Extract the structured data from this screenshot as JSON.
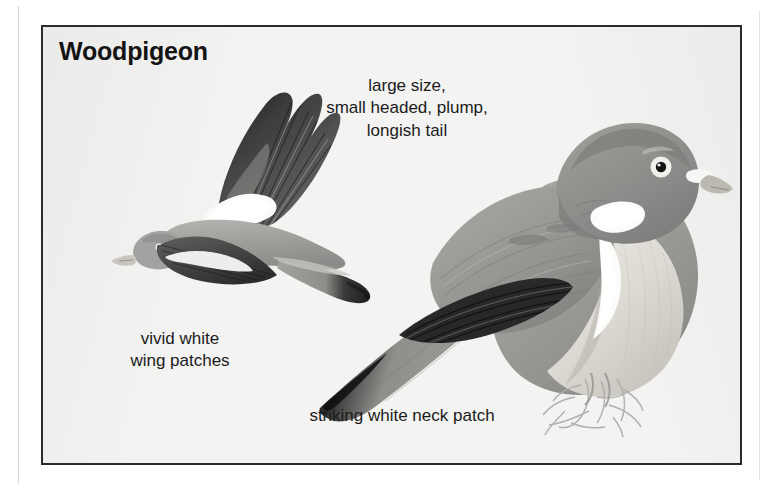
{
  "plate": {
    "title": "Woodpigeon",
    "background_color": "#f3f3f2",
    "border_color": "#2b2b2b",
    "text_color": "#1b1b1b"
  },
  "captions": {
    "traits": "large size,\nsmall headed, plump,\nlongish tail",
    "wing_patches": "vivid white\nwing patches",
    "neck_patch": "striking white neck patch"
  },
  "illustrations": {
    "flying": {
      "name": "woodpigeon-in-flight",
      "palette": {
        "body_grey": "#9a9a98",
        "body_light": "#b9b9b6",
        "wing_dark": "#3a3a3a",
        "wing_black": "#1e1e1e",
        "white_patch": "#fbfbfa",
        "beak": "#c9c6bf"
      }
    },
    "perched": {
      "name": "woodpigeon-perched",
      "palette": {
        "mantle_grey": "#9c9c99",
        "crown_grey": "#8d8d8b",
        "breast_pale": "#d9d7d2",
        "belly_pale": "#e6e4df",
        "primaries_black": "#222222",
        "white_patch": "#fcfcfb",
        "beak": "#bdb9b1",
        "cere_white": "#f6f6f4",
        "eye_ring": "#efefec",
        "pupil": "#161616",
        "perch_twig": "#aeaeac"
      }
    }
  }
}
